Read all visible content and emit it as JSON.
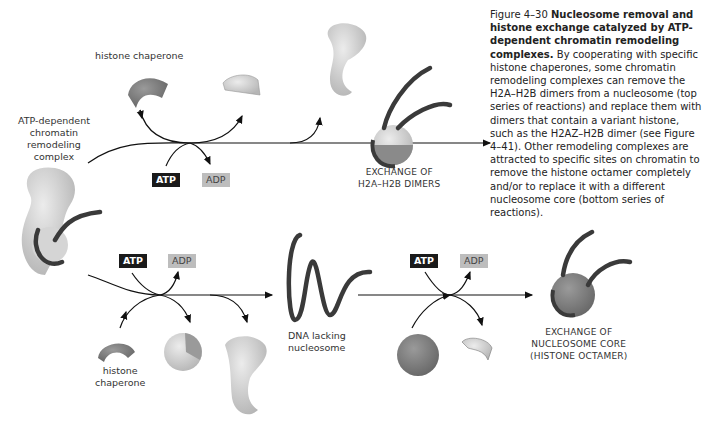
{
  "caption": {
    "figure_number": "Figure 4–30",
    "title": "Nucleosome removal and histone exchange catalyzed by ATP-dependent chromatin remodeling complexes.",
    "body": "By cooperating with specific histone chaperones, some chromatin remodeling complexes can remove the H2A–H2B dimers from a nucleosome (top series of reactions) and replace them with dimers that contain a variant histone, such as the H2AZ–H2B dimer (see Figure 4–41). Other remodeling complexes are attracted to specific sites on chromatin to remove the histone octamer completely and/or to replace it with a different nucleosome core (bottom series of reactions)."
  },
  "labels": {
    "histone_chaperone_top": "histone chaperone",
    "remodeling_complex": [
      "ATP-dependent",
      "chromatin",
      "remodeling",
      "complex"
    ],
    "exchange_dimers": [
      "EXCHANGE OF",
      "H2A–H2B DIMERS"
    ],
    "dna_lacking": [
      "DNA lacking",
      "nucleosome"
    ],
    "histone_chaperone_bottom": [
      "histone",
      "chaperone"
    ],
    "exchange_core": [
      "EXCHANGE OF",
      "NUCLEOSOME CORE",
      "(HISTONE OCTAMER)"
    ]
  },
  "badges": {
    "top_atp": "ATP",
    "top_adp": "ADP",
    "bottom1_atp": "ATP",
    "bottom1_adp": "ADP",
    "bottom2_atp": "ATP",
    "bottom2_adp": "ADP"
  },
  "colors": {
    "dna": "#3a3a3a",
    "histone_light": "#cfcfcf",
    "histone_dark": "#8a8a8a",
    "complex": "#d8d8d8",
    "atp_bg": "#1a1a1a",
    "adp_bg": "#bdbdbd"
  }
}
